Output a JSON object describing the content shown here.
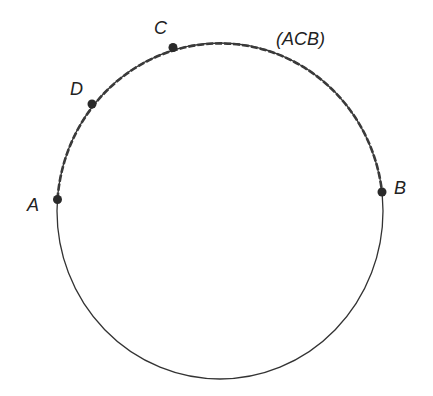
{
  "diagram": {
    "type": "circle-arc",
    "circle": {
      "cx": 220,
      "cy": 211,
      "rx": 163,
      "ry": 168,
      "stroke": "#333333"
    },
    "arc": {
      "name": "(ACB)",
      "from": "A",
      "via": "C",
      "to": "B",
      "style": "bold-dashed"
    },
    "points": [
      {
        "id": "A",
        "label": "A",
        "x": 57.5,
        "y": 199.5,
        "label_x": 27,
        "label_y": 211
      },
      {
        "id": "D",
        "label": "D",
        "x": 92,
        "y": 104,
        "label_x": 70,
        "label_y": 95
      },
      {
        "id": "C",
        "label": "C",
        "x": 173,
        "y": 47.5,
        "label_x": 154,
        "label_y": 34
      },
      {
        "id": "B",
        "label": "B",
        "x": 382,
        "y": 192,
        "label_x": 394,
        "label_y": 194
      }
    ],
    "arc_label": {
      "text": "(ACB)",
      "x": 276,
      "y": 45
    }
  }
}
